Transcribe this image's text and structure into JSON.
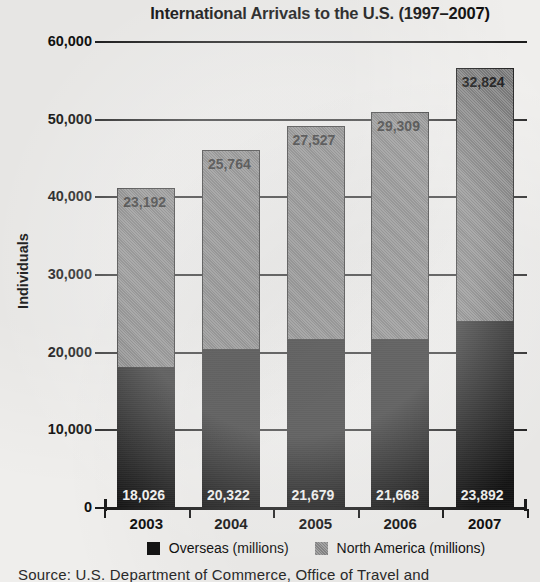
{
  "chart_data": {
    "type": "bar",
    "subtype": "stacked",
    "title": "International Arrivals to the U.S. (1997–2007)",
    "xlabel": "",
    "ylabel": "Individuals",
    "categories": [
      "2003",
      "2004",
      "2005",
      "2006",
      "2007"
    ],
    "series": [
      {
        "name": "Overseas (millions)",
        "color": "#141414",
        "values": [
          18026,
          20322,
          21679,
          21668,
          23892
        ],
        "labels": [
          "18,026",
          "20,322",
          "21,679",
          "21,668",
          "23,892"
        ]
      },
      {
        "name": "North America (millions)",
        "color": "#767676",
        "values": [
          23192,
          25764,
          27527,
          29309,
          32824
        ],
        "labels": [
          "23,192",
          "25,764",
          "27,527",
          "29,309",
          "32,824"
        ]
      }
    ],
    "totals": [
      41218,
      46086,
      49206,
      50977,
      56716
    ],
    "ylim": [
      0,
      60000
    ],
    "ytick_values": [
      0,
      10000,
      20000,
      30000,
      40000,
      50000,
      60000
    ],
    "ytick_labels": [
      "0",
      "10,000",
      "20,000",
      "30,000",
      "40,000",
      "50,000",
      "60,000"
    ],
    "grid": true,
    "legend_position": "bottom"
  },
  "source": {
    "text": "Source: U.S. Department of Commerce, Office of Travel and"
  }
}
